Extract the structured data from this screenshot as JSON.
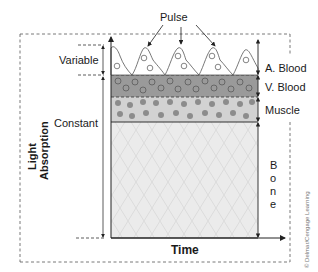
{
  "diagram": {
    "axes": {
      "y_label_line1": "Light",
      "y_label_line2": "Absorption",
      "x_label": "Time"
    },
    "annotations": {
      "pulse": "Pulse",
      "variable": "Variable",
      "constant": "Constant"
    },
    "layers": [
      {
        "label": "A. Blood",
        "color": "#ffffff"
      },
      {
        "label": "V. Blood",
        "color": "#9a9a9a"
      },
      {
        "label": "Muscle",
        "color": "#d2d2d2"
      },
      {
        "label": "Bone",
        "color": "#ebebeb"
      }
    ],
    "bone_letters": [
      "B",
      "o",
      "n",
      "e"
    ],
    "copyright": "© Delmar/Cengage Learning",
    "colors": {
      "line": "#333333",
      "venous_band": "#9a9a9a",
      "muscle_band": "#d2d2d2",
      "bone_fill": "#ebebeb",
      "muscle_dot": "#8c8c8c"
    }
  }
}
